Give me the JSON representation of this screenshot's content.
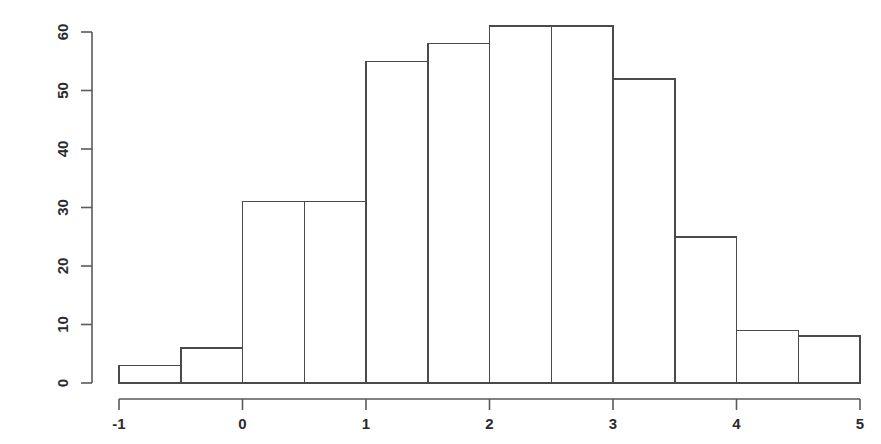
{
  "chart_data": {
    "type": "bar",
    "title": "",
    "subtitle": "",
    "xlabel": "",
    "ylabel": "",
    "bin_width": 0.5,
    "bin_edges": [
      -1,
      -0.5,
      0,
      0.5,
      1,
      1.5,
      2,
      2.5,
      3,
      3.5,
      4,
      4.5,
      5
    ],
    "categories": [
      "-1 to -0.5",
      "-0.5 to 0",
      "0 to 0.5",
      "0.5 to 1",
      "1 to 1.5",
      "1.5 to 2",
      "2 to 2.5",
      "2.5 to 3",
      "3 to 3.5",
      "3.5 to 4",
      "4 to 4.5",
      "4.5 to 5"
    ],
    "values": [
      3,
      6,
      31,
      31,
      55,
      58,
      61,
      61,
      52,
      25,
      9,
      8
    ],
    "xlim": [
      -1,
      5
    ],
    "ylim": [
      0,
      60
    ],
    "xticks": [
      -1,
      0,
      1,
      2,
      3,
      4,
      5
    ],
    "xtick_labels": [
      "-1",
      "0",
      "1",
      "2",
      "3",
      "4",
      "5"
    ],
    "yticks": [
      0,
      10,
      20,
      30,
      40,
      50,
      60
    ],
    "ytick_labels": [
      "0",
      "10",
      "20",
      "30",
      "40",
      "50",
      "60"
    ],
    "grid": false,
    "legend": null,
    "legend_position": "none",
    "bar_fill_color": "#ffffff",
    "bar_stroke_color": "#4a4a4a",
    "axis_color": "#5a5a5a",
    "background_color": "#ffffff",
    "ytick_label_rotation": -90
  },
  "layout": {
    "plot_left": 119,
    "plot_right": 860,
    "baseline_y": 383,
    "ytop_y": 32,
    "axis_x": 92,
    "xaxis_y": 399
  }
}
